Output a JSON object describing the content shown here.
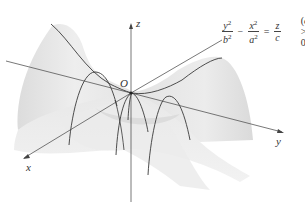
{
  "figure": {
    "type": "hyperbolic-paraboloid"
  },
  "axes": {
    "x_label": "x",
    "y_label": "y",
    "z_label": "z",
    "origin_label": "O"
  },
  "equation": {
    "term1_num": "y",
    "term1_exp": "2",
    "term1_den": "b",
    "term1_den_exp": "2",
    "minus": "−",
    "term2_num": "x",
    "term2_exp": "2",
    "term2_den": "a",
    "term2_den_exp": "2",
    "equals": "=",
    "rhs_num": "z",
    "rhs_den": "c",
    "condition_open": "(",
    "condition_var": "c",
    "condition_rest": " > 0)"
  },
  "colors": {
    "surface_fill": "#e6e6e6",
    "surface_light": "#f3f3f3",
    "surface_shadow": "#d2d2d2",
    "curve": "#3a3a3a",
    "axis": "#555555"
  }
}
